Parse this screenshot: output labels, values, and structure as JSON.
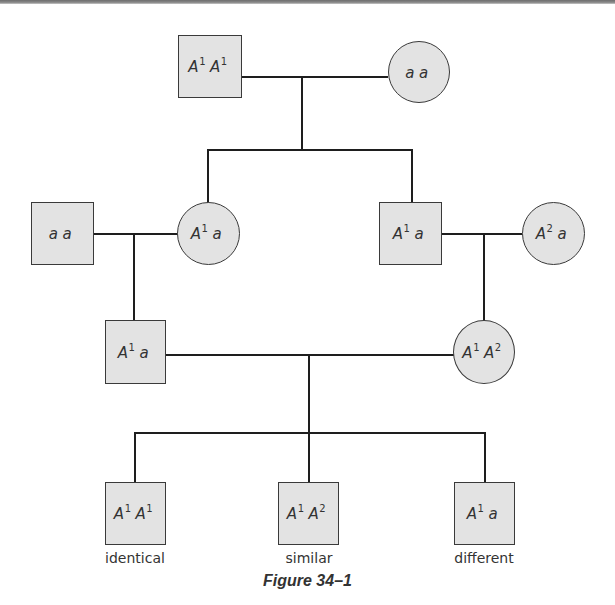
{
  "figure": {
    "caption": "Figure 34–1",
    "type": "pedigree"
  },
  "generations": [
    {
      "index": 1,
      "individuals": [
        {
          "id": "g1-male",
          "sex": "male",
          "shape": "square",
          "allele1": "A",
          "sup1": "1",
          "allele2": "A",
          "sup2": "1",
          "genotype": "A1 A1"
        },
        {
          "id": "g1-female",
          "sex": "female",
          "shape": "circle",
          "allele1": "a",
          "sup1": "",
          "allele2": "a",
          "sup2": "",
          "genotype": "a a"
        }
      ]
    },
    {
      "index": 2,
      "individuals": [
        {
          "id": "g2-spouse-male",
          "sex": "male",
          "shape": "square",
          "allele1": "a",
          "sup1": "",
          "allele2": "a",
          "sup2": "",
          "genotype": "a a"
        },
        {
          "id": "g2-daughter",
          "sex": "female",
          "shape": "circle",
          "allele1": "A",
          "sup1": "1",
          "allele2": "a",
          "sup2": "",
          "genotype": "A1 a"
        },
        {
          "id": "g2-son",
          "sex": "male",
          "shape": "square",
          "allele1": "A",
          "sup1": "1",
          "allele2": "a",
          "sup2": "",
          "genotype": "A1 a"
        },
        {
          "id": "g2-spouse-female",
          "sex": "female",
          "shape": "circle",
          "allele1": "A",
          "sup1": "2",
          "allele2": "a",
          "sup2": "",
          "genotype": "A2 a"
        }
      ]
    },
    {
      "index": 3,
      "individuals": [
        {
          "id": "g3-male",
          "sex": "male",
          "shape": "square",
          "allele1": "A",
          "sup1": "1",
          "allele2": "a",
          "sup2": "",
          "genotype": "A1 a"
        },
        {
          "id": "g3-female",
          "sex": "female",
          "shape": "circle",
          "allele1": "A",
          "sup1": "1",
          "allele2": "A",
          "sup2": "2",
          "genotype": "A1 A2"
        }
      ]
    },
    {
      "index": 4,
      "individuals": [
        {
          "id": "g4-child-1",
          "sex": "male",
          "shape": "square",
          "allele1": "A",
          "sup1": "1",
          "allele2": "A",
          "sup2": "1",
          "genotype": "A1 A1",
          "label": "identical"
        },
        {
          "id": "g4-child-2",
          "sex": "male",
          "shape": "square",
          "allele1": "A",
          "sup1": "1",
          "allele2": "A",
          "sup2": "2",
          "genotype": "A1 A2",
          "label": "similar"
        },
        {
          "id": "g4-child-3",
          "sex": "male",
          "shape": "square",
          "allele1": "A",
          "sup1": "1",
          "allele2": "a",
          "sup2": "",
          "genotype": "A1 a",
          "label": "different"
        }
      ]
    }
  ],
  "colors": {
    "fill": "#e3e3e3",
    "stroke": "#3a3a3a",
    "line": "#1e1e1e",
    "text": "#333333"
  }
}
